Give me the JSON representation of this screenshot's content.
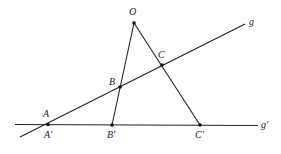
{
  "diagram": {
    "type": "geometry-perspectivity",
    "colors": {
      "stroke": "#222222",
      "point": "#111111",
      "background": "#ffffff"
    },
    "center": {
      "name": "O",
      "x": 134,
      "y": 23,
      "label_x": 129,
      "label_y": 15
    },
    "lines": [
      {
        "name": "g",
        "x1": 20,
        "y1": 137,
        "x2": 245,
        "y2": 24,
        "label": "g",
        "label_x": 249,
        "label_y": 25
      },
      {
        "name": "g'",
        "x1": 15,
        "y1": 124.5,
        "x2": 258,
        "y2": 125.5,
        "label": "g'",
        "label_x": 261,
        "label_y": 128
      }
    ],
    "rays": [
      {
        "from": "O",
        "to": "B'",
        "x1": 134,
        "y1": 23,
        "x2": 112,
        "y2": 125
      },
      {
        "from": "O",
        "to": "C'",
        "x1": 134,
        "y1": 23,
        "x2": 200,
        "y2": 125
      }
    ],
    "points": [
      {
        "name": "A",
        "x": 48,
        "y": 124.5,
        "label": "A",
        "label_x": 43,
        "label_y": 117
      },
      {
        "name": "B",
        "x": 120,
        "y": 87,
        "label": "B",
        "label_x": 109,
        "label_y": 85
      },
      {
        "name": "C",
        "x": 162,
        "y": 65,
        "label": "C",
        "label_x": 158,
        "label_y": 58
      },
      {
        "name": "A'",
        "x": 48,
        "y": 124.5,
        "label": "A'",
        "label_x": 44,
        "label_y": 138
      },
      {
        "name": "B'",
        "x": 112,
        "y": 125,
        "label": "B'",
        "label_x": 107,
        "label_y": 138
      },
      {
        "name": "C'",
        "x": 200,
        "y": 125,
        "label": "C'",
        "label_x": 195,
        "label_y": 138
      }
    ]
  }
}
